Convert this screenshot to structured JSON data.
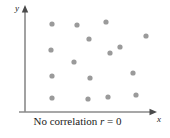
{
  "figure": {
    "caption_prefix": "No correlation ",
    "caption_var": "r",
    "caption_suffix": " = 0",
    "caption_full": "No correlation r = 0",
    "x_axis_label": "x",
    "y_axis_label": "y",
    "point_color": "#9a9a9a",
    "axis_color": "#8a8a8a",
    "arrow_color": "#4a4a4a",
    "background_color": "#ffffff"
  },
  "chart_data": {
    "type": "scatter",
    "title": "",
    "subtitle": "",
    "annotation": "No correlation r = 0",
    "correlation_r": 0,
    "xlabel": "x",
    "ylabel": "y",
    "grid": false,
    "legend": false,
    "axis_style": "arrowed-open",
    "xlim": [
      0,
      170
    ],
    "ylim": [
      0,
      138
    ],
    "n_points": 16,
    "points": [
      {
        "x": 52,
        "y": 24
      },
      {
        "x": 77,
        "y": 25
      },
      {
        "x": 106,
        "y": 22
      },
      {
        "x": 146,
        "y": 36
      },
      {
        "x": 89,
        "y": 39
      },
      {
        "x": 51,
        "y": 50
      },
      {
        "x": 120,
        "y": 47
      },
      {
        "x": 110,
        "y": 53
      },
      {
        "x": 74,
        "y": 62
      },
      {
        "x": 52,
        "y": 76
      },
      {
        "x": 90,
        "y": 78
      },
      {
        "x": 133,
        "y": 73
      },
      {
        "x": 52,
        "y": 98
      },
      {
        "x": 88,
        "y": 99
      },
      {
        "x": 108,
        "y": 97
      },
      {
        "x": 136,
        "y": 95
      }
    ],
    "point_radius": 2.6
  }
}
